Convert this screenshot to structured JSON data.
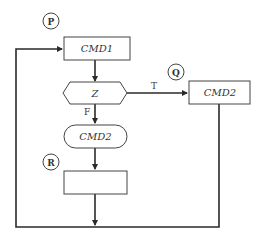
{
  "diagram": {
    "type": "flowchart",
    "connectors": [
      {
        "id": "P",
        "label": "P"
      },
      {
        "id": "Q",
        "label": "Q"
      },
      {
        "id": "R",
        "label": "R"
      }
    ],
    "nodes": {
      "cmd1": {
        "label": "CMD1",
        "shape": "rectangle"
      },
      "decision": {
        "label": "Z",
        "shape": "hexagon"
      },
      "cmd2_true": {
        "label": "CMD2",
        "shape": "rectangle"
      },
      "cmd2_false": {
        "label": "CMD2",
        "shape": "rounded-rectangle"
      },
      "empty": {
        "label": "",
        "shape": "rectangle"
      }
    },
    "edges": {
      "true_label": "T",
      "false_label": "F"
    },
    "colors": {
      "line": "#2a2a2a",
      "shape_border": "#444444",
      "background": "#ffffff"
    }
  }
}
